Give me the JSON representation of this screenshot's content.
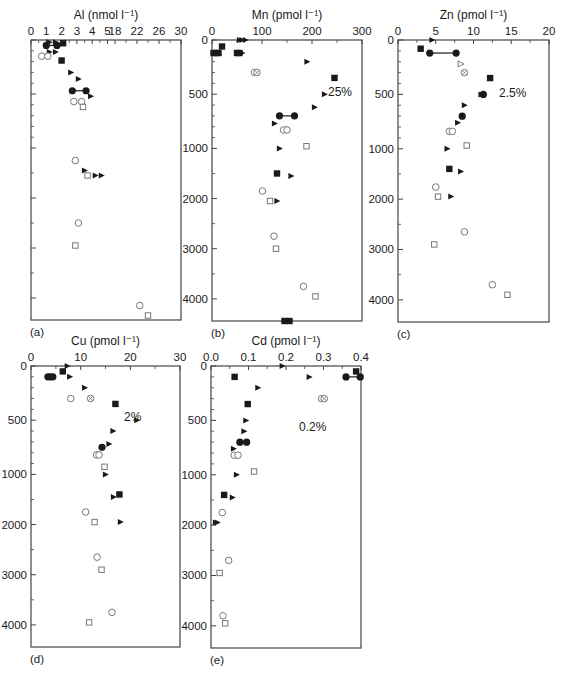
{
  "figure": {
    "panel_labels": [
      "(a)",
      "(b)",
      "(c)",
      "(d)",
      "(e)"
    ],
    "y_tick_labels": [
      "0",
      "500",
      "1000",
      "2000",
      "3000",
      "4000"
    ]
  },
  "chart_data": [
    {
      "id": "a",
      "type": "scatter",
      "panel_label": "(a)",
      "title": "Al (nmol l⁻¹)",
      "xlabel": "Al (nmol l⁻¹)",
      "ylabel": "Depth (m)",
      "x_ticks": [
        "0",
        "1",
        "2",
        "3",
        "4",
        "5",
        "18",
        "22",
        "26",
        "30"
      ],
      "x_axis_note": "broken axis: 0-5 linear then 18-30",
      "y_ticks": [
        0,
        500,
        1000,
        2000,
        3000,
        4000
      ],
      "y_tick_labels_shown": false,
      "ylim": [
        0,
        4460
      ],
      "annotation": "",
      "series": [
        {
          "name": "filled-square",
          "marker": "square-filled",
          "points": [
            [
              2.1,
              30
            ],
            [
              2.0,
              190
            ]
          ]
        },
        {
          "name": "filled-triangle",
          "marker": "triangle-filled",
          "points": [
            [
              1.2,
              20
            ],
            [
              1.6,
              20
            ],
            [
              1.2,
              110
            ],
            [
              1.6,
              110
            ],
            [
              2.6,
              300
            ],
            [
              3.1,
              360
            ],
            [
              3.9,
              520
            ],
            [
              3.5,
              1450
            ],
            [
              4.2,
              1550
            ],
            [
              4.6,
              1550
            ]
          ]
        },
        {
          "name": "filled-circle",
          "marker": "circle-filled",
          "points": [
            [
              1.0,
              50
            ],
            [
              1.7,
              50
            ],
            [
              2.7,
              470
            ],
            [
              3.6,
              470
            ]
          ],
          "connected_pairs": [
            [
              0,
              1
            ],
            [
              2,
              3
            ]
          ]
        },
        {
          "name": "open-circle",
          "marker": "circle-open",
          "points": [
            [
              0.7,
              150
            ],
            [
              1.1,
              150
            ],
            [
              2.8,
              570
            ],
            [
              3.3,
              570
            ],
            [
              2.9,
              1250
            ],
            [
              3.1,
              2500
            ],
            [
              22.5,
              4150
            ]
          ]
        },
        {
          "name": "open-square",
          "marker": "square-open",
          "points": [
            [
              3.4,
              620
            ],
            [
              3.7,
              1550
            ],
            [
              2.9,
              2950
            ],
            [
              24.0,
              4350
            ]
          ]
        }
      ]
    },
    {
      "id": "b",
      "type": "scatter",
      "panel_label": "(b)",
      "title": "Mn (pmol l⁻¹)",
      "xlabel": "Mn (pmol l⁻¹)",
      "ylabel": "Depth (m)",
      "x_ticks": [
        0,
        100,
        200,
        300
      ],
      "xlim": [
        0,
        300
      ],
      "y_ticks": [
        0,
        500,
        1000,
        2000,
        3000,
        4000
      ],
      "ylim": [
        0,
        4460
      ],
      "annotation": "25%",
      "series": [
        {
          "name": "filled-square",
          "marker": "square-filled",
          "points": [
            [
              20,
              60
            ],
            [
              3,
              120
            ],
            [
              8,
              120
            ],
            [
              13,
              120
            ],
            [
              50,
              120
            ],
            [
              55,
              120
            ],
            [
              245,
              350
            ],
            [
              130,
              1500
            ],
            [
              145,
              4440
            ],
            [
              155,
              4440
            ]
          ]
        },
        {
          "name": "filled-triangle",
          "marker": "triangle-filled",
          "points": [
            [
              55,
              0
            ],
            [
              60,
              0
            ],
            [
              67,
              0
            ],
            [
              60,
              120
            ],
            [
              190,
              200
            ],
            [
              225,
              500
            ],
            [
              205,
              620
            ],
            [
              125,
              770
            ],
            [
              135,
              1000
            ],
            [
              158,
              1550
            ],
            [
              130,
              2050
            ]
          ]
        },
        {
          "name": "filled-circle",
          "marker": "circle-filled",
          "points": [
            [
              135,
              700
            ],
            [
              165,
              700
            ]
          ],
          "connected_pairs": [
            [
              0,
              1
            ]
          ]
        },
        {
          "name": "open-circle",
          "marker": "circle-open",
          "points": [
            [
              85,
              300
            ],
            [
              143,
              830
            ],
            [
              150,
              830
            ],
            [
              101,
              1850
            ],
            [
              124,
              2750
            ],
            [
              183,
              3750
            ]
          ]
        },
        {
          "name": "open-circle-crossed",
          "marker": "circle-crossed",
          "points": [
            [
              90,
              300
            ]
          ]
        },
        {
          "name": "open-square",
          "marker": "square-open",
          "points": [
            [
              189,
              980
            ],
            [
              116,
              2050
            ],
            [
              128,
              3000
            ],
            [
              207,
              3950
            ]
          ]
        }
      ]
    },
    {
      "id": "c",
      "type": "scatter",
      "panel_label": "(c)",
      "title": "Zn (pmol l⁻¹)",
      "xlabel": "Zn (pmol l⁻¹)",
      "ylabel": "Depth (m)",
      "x_ticks": [
        0,
        5,
        10,
        15,
        20
      ],
      "xlim": [
        0,
        20
      ],
      "y_ticks": [
        0,
        500,
        1000,
        2000,
        3000,
        4000
      ],
      "ylim": [
        0,
        4460
      ],
      "annotation": "2.5%",
      "series": [
        {
          "name": "filled-square",
          "marker": "square-filled",
          "points": [
            [
              3.0,
              80
            ],
            [
              12.2,
              350
            ],
            [
              6.8,
              1400
            ]
          ]
        },
        {
          "name": "filled-triangle",
          "marker": "triangle-filled",
          "points": [
            [
              4.5,
              0
            ],
            [
              11.0,
              500
            ],
            [
              8.8,
              600
            ],
            [
              7.9,
              760
            ],
            [
              6.5,
              1000
            ],
            [
              8.3,
              1450
            ],
            [
              7.0,
              1950
            ]
          ]
        },
        {
          "name": "filled-circle",
          "marker": "circle-filled",
          "points": [
            [
              4.2,
              120
            ],
            [
              7.7,
              120
            ],
            [
              11.3,
              500
            ],
            [
              8.5,
              700
            ]
          ],
          "connected_pairs": [
            [
              0,
              1
            ]
          ]
        },
        {
          "name": "open-triangle",
          "marker": "triangle-open",
          "points": [
            [
              8.3,
              220
            ]
          ]
        },
        {
          "name": "open-circle-crossed",
          "marker": "circle-crossed",
          "points": [
            [
              8.8,
              300
            ]
          ]
        },
        {
          "name": "open-circle",
          "marker": "circle-open",
          "points": [
            [
              6.8,
              840
            ],
            [
              7.2,
              840
            ],
            [
              5.0,
              1760
            ],
            [
              8.8,
              2650
            ],
            [
              12.5,
              3700
            ]
          ]
        },
        {
          "name": "open-square",
          "marker": "square-open",
          "points": [
            [
              9.1,
              970
            ],
            [
              5.3,
              1950
            ],
            [
              4.8,
              2900
            ],
            [
              14.5,
              3900
            ]
          ]
        }
      ]
    },
    {
      "id": "d",
      "type": "scatter",
      "panel_label": "(d)",
      "title": "Cu (pmol l⁻¹)",
      "xlabel": "Cu (pmol l⁻¹)",
      "ylabel": "Depth (m)",
      "x_ticks": [
        0,
        10,
        20,
        30
      ],
      "xlim": [
        0,
        30
      ],
      "y_ticks": [
        0,
        500,
        1000,
        2000,
        3000,
        4000
      ],
      "ylim": [
        0,
        4460
      ],
      "annotation": "2%",
      "series": [
        {
          "name": "filled-square",
          "marker": "square-filled",
          "points": [
            [
              6.4,
              50
            ],
            [
              17.0,
              350
            ],
            [
              17.8,
              1400
            ]
          ]
        },
        {
          "name": "filled-triangle",
          "marker": "triangle-filled",
          "points": [
            [
              7.3,
              0
            ],
            [
              7.8,
              100
            ],
            [
              10.8,
              200
            ],
            [
              21.3,
              500
            ],
            [
              16.5,
              600
            ],
            [
              15.7,
              720
            ],
            [
              15.0,
              1000
            ],
            [
              16.6,
              1450
            ],
            [
              18.0,
              1950
            ]
          ]
        },
        {
          "name": "filled-circle",
          "marker": "circle-filled",
          "points": [
            [
              3.4,
              100
            ],
            [
              3.9,
              100
            ],
            [
              4.4,
              100
            ],
            [
              14.3,
              750
            ]
          ]
        },
        {
          "name": "open-circle",
          "marker": "circle-open",
          "points": [
            [
              8.0,
              300
            ],
            [
              13.2,
              820
            ],
            [
              13.7,
              820
            ],
            [
              11.0,
              1750
            ],
            [
              13.3,
              2650
            ],
            [
              16.3,
              3750
            ]
          ]
        },
        {
          "name": "open-circle-crossed",
          "marker": "circle-crossed",
          "points": [
            [
              12.0,
              300
            ]
          ]
        },
        {
          "name": "open-square",
          "marker": "square-open",
          "points": [
            [
              14.8,
              930
            ],
            [
              12.8,
              1950
            ],
            [
              14.2,
              2900
            ],
            [
              11.7,
              3950
            ]
          ]
        }
      ]
    },
    {
      "id": "e",
      "type": "scatter",
      "panel_label": "(e)",
      "title": "Cd (pmol l⁻¹)",
      "xlabel": "Cd (pmol l⁻¹)",
      "ylabel": "Depth (m)",
      "x_ticks": [
        "0.0",
        "0.1",
        "0.2",
        "0.3",
        "0.4"
      ],
      "xlim": [
        0,
        0.4
      ],
      "y_ticks": [
        0,
        500,
        1000,
        2000,
        3000,
        4000
      ],
      "ylim": [
        0,
        4460
      ],
      "annotation": "0.2%",
      "series": [
        {
          "name": "filled-square",
          "marker": "square-filled",
          "points": [
            [
              0.387,
              50
            ],
            [
              0.063,
              100
            ],
            [
              0.098,
              350
            ],
            [
              0.035,
              1400
            ]
          ]
        },
        {
          "name": "filled-triangle",
          "marker": "triangle-filled",
          "points": [
            [
              0.19,
              0
            ],
            [
              0.262,
              100
            ],
            [
              0.125,
              200
            ],
            [
              0.093,
              500
            ],
            [
              0.088,
              600
            ],
            [
              0.06,
              760
            ],
            [
              0.068,
              1000
            ],
            [
              0.057,
              1450
            ],
            [
              0.017,
              1950
            ],
            [
              0.012,
              1950
            ]
          ]
        },
        {
          "name": "filled-circle",
          "marker": "circle-filled",
          "points": [
            [
              0.36,
              100
            ],
            [
              0.398,
              100
            ],
            [
              0.077,
              700
            ],
            [
              0.095,
              700
            ]
          ],
          "connected_pairs": [
            [
              0,
              1
            ]
          ]
        },
        {
          "name": "open-circle",
          "marker": "circle-open",
          "points": [
            [
              0.295,
              300
            ],
            [
              0.062,
              820
            ],
            [
              0.072,
              820
            ],
            [
              0.03,
              1750
            ],
            [
              0.047,
              2700
            ],
            [
              0.032,
              3800
            ]
          ]
        },
        {
          "name": "open-circle-crossed",
          "marker": "circle-crossed",
          "points": [
            [
              0.302,
              300
            ]
          ]
        },
        {
          "name": "open-square",
          "marker": "square-open",
          "points": [
            [
              0.115,
              970
            ],
            [
              0.023,
              2950
            ],
            [
              0.038,
              3950
            ]
          ]
        }
      ]
    }
  ]
}
